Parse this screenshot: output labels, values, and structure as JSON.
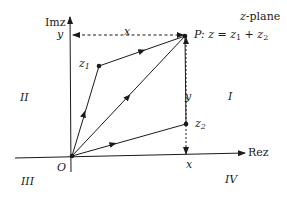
{
  "title": "z-plane",
  "axes": {
    "imag_label": "Imz",
    "real_label": "Rez",
    "origin_label": "O"
  },
  "quadrants": {
    "q1": "I",
    "q2": "II",
    "q3": "III",
    "q4": "IV"
  },
  "points": {
    "z1": {
      "label": "z",
      "sub": "1"
    },
    "z2": {
      "label": "z",
      "sub": "2"
    },
    "P": {
      "label": "P: z = z",
      "sub1": "1",
      "mid": " + z",
      "sub2": "2"
    }
  },
  "projections": {
    "x_top": "x",
    "y_left": "y",
    "y_right": "y",
    "x_bottom": "x"
  },
  "colors": {
    "ink": "#1a1a1a",
    "background": "#ffffff"
  }
}
